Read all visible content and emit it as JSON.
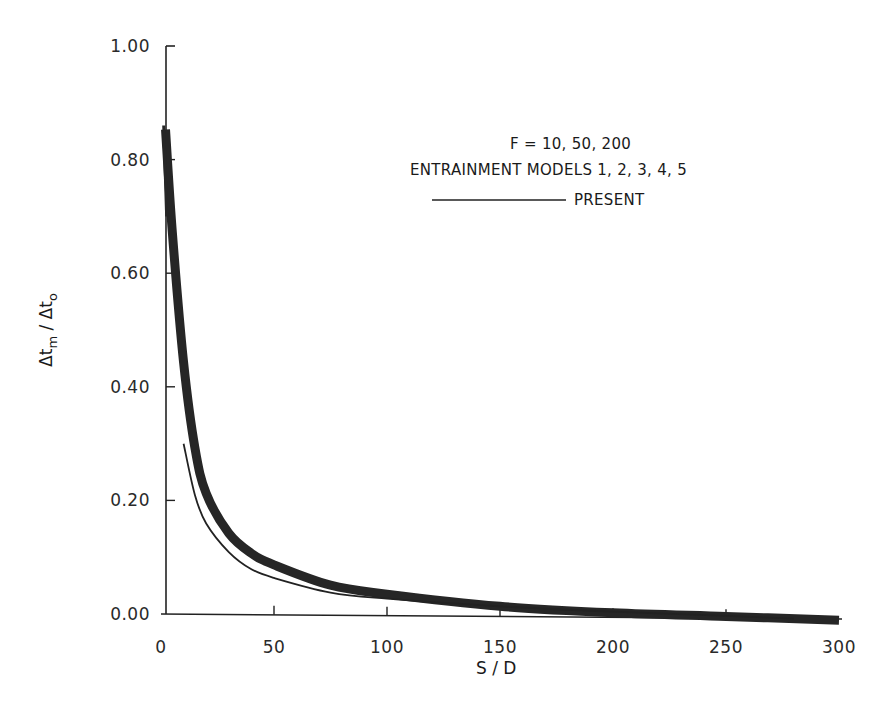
{
  "chart_data": {
    "type": "line",
    "title": "",
    "xlabel": "S/D",
    "ylabel": "Δt_m/Δt_o",
    "xlim": [
      0,
      300
    ],
    "ylim": [
      0,
      1.0
    ],
    "x_ticks": [
      "0",
      "50",
      "100",
      "150",
      "200",
      "250",
      "300"
    ],
    "y_ticks": [
      "0.00",
      "0.20",
      "0.40",
      "0.60",
      "0.80",
      "1.00"
    ],
    "grid": false,
    "legend_position": "upper right (inside)",
    "annotations": [
      "F = 10, 50, 200",
      "ENTRAINMENT MODELS 1, 2, 3, 4, 5"
    ],
    "series": [
      {
        "name": "Entrainment models 1-5 (band, F = 10, 50, 200)",
        "style": "thick dark band",
        "x": [
          2,
          5,
          10,
          15,
          20,
          30,
          40,
          50,
          75,
          100,
          150,
          200,
          250,
          300
        ],
        "values": [
          0.86,
          0.68,
          0.45,
          0.3,
          0.22,
          0.15,
          0.115,
          0.095,
          0.06,
          0.045,
          0.025,
          0.015,
          0.01,
          0.005
        ]
      },
      {
        "name": "PRESENT",
        "style": "thin solid line",
        "x": [
          10,
          15,
          20,
          30,
          40,
          50,
          75,
          100,
          150,
          200,
          250,
          280
        ],
        "values": [
          0.3,
          0.21,
          0.16,
          0.11,
          0.08,
          0.065,
          0.04,
          0.03,
          0.018,
          0.01,
          0.004,
          0.0
        ]
      }
    ]
  },
  "legend": {
    "line1": "F = 10, 50, 200",
    "line2": "ENTRAINMENT MODELS 1, 2, 3, 4, 5",
    "line3": "PRESENT"
  },
  "axes": {
    "xlabel": "S / D",
    "ylabel_main": "Δt",
    "ylabel_sub1": "m",
    "ylabel_slash": " / Δt",
    "ylabel_sub2": "o"
  }
}
